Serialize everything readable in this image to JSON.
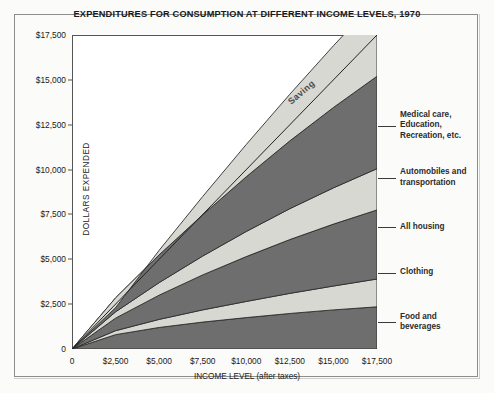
{
  "chart_data": {
    "type": "area",
    "title": "EXPENDITURES FOR CONSUMPTION AT DIFFERENT INCOME LEVELS, 1970",
    "xlabel": "INCOME LEVEL (after taxes)",
    "ylabel": "DOLLARS EXPENDED",
    "xlim": [
      0,
      17500
    ],
    "ylim": [
      0,
      17500
    ],
    "grid": false,
    "legend_position": "right-callouts",
    "x_ticks": [
      "0",
      "$2,500",
      "$5,000",
      "$7,500",
      "$10,000",
      "$12,500",
      "$15,000",
      "$17,500"
    ],
    "x_tick_values": [
      0,
      2500,
      5000,
      7500,
      10000,
      12500,
      15000,
      17500
    ],
    "y_ticks": [
      "0",
      "$2,500",
      "$5,000",
      "$7,500",
      "$10,000",
      "$12,500",
      "$15,000",
      "$17,500"
    ],
    "y_tick_values": [
      0,
      2500,
      5000,
      7500,
      10000,
      12500,
      15000,
      17500
    ],
    "x": [
      0,
      2500,
      5000,
      7500,
      10000,
      12500,
      15000,
      17500
    ],
    "series": [
      {
        "name": "Food and beverages",
        "shade": "dark",
        "values": [
          0,
          800,
          1200,
          1500,
          1750,
          1980,
          2180,
          2350
        ]
      },
      {
        "name": "Clothing",
        "shade": "light",
        "values": [
          0,
          220,
          450,
          680,
          900,
          1120,
          1330,
          1550
        ]
      },
      {
        "name": "All housing",
        "shade": "dark",
        "values": [
          0,
          700,
          1350,
          1950,
          2500,
          3000,
          3450,
          3850
        ]
      },
      {
        "name": "Automobiles and transportation",
        "shade": "light",
        "values": [
          0,
          350,
          700,
          1050,
          1400,
          1720,
          2020,
          2300
        ]
      },
      {
        "name": "Medical care, Education, Recreation, etc.",
        "shade": "dark",
        "values": [
          0,
          780,
          1550,
          2300,
          3050,
          3780,
          4480,
          5150
        ]
      },
      {
        "name": "Saving",
        "shade": "light",
        "values": [
          0,
          -550,
          250,
          1020,
          1800,
          2600,
          3440,
          4300
        ]
      }
    ],
    "reference_line": {
      "name": "income equals expenditure 45-degree line",
      "from": [
        0,
        0
      ],
      "to": [
        17500,
        17500
      ]
    },
    "callouts": [
      {
        "label_lines": [
          "Medical care,",
          "Education,",
          "Recreation, etc."
        ],
        "anchor_y": 12450
      },
      {
        "label_lines": [
          "Automobiles and",
          "transportation"
        ],
        "anchor_y": 9550
      },
      {
        "label_lines": [
          "All housing"
        ],
        "anchor_y": 6800
      },
      {
        "label_lines": [
          "Clothing"
        ],
        "anchor_y": 4250
      },
      {
        "label_lines": [
          "Food and",
          "beverages"
        ],
        "anchor_y": 1500
      }
    ],
    "inline_label": "Saving",
    "colors": {
      "dark_band": "#6e6e6e",
      "light_band": "#d8d8d2",
      "band_outline": "#2e2e2e",
      "page_background": "#fbfbf9",
      "plot_background": "#ffffff",
      "text": "#1a1a1a"
    }
  }
}
